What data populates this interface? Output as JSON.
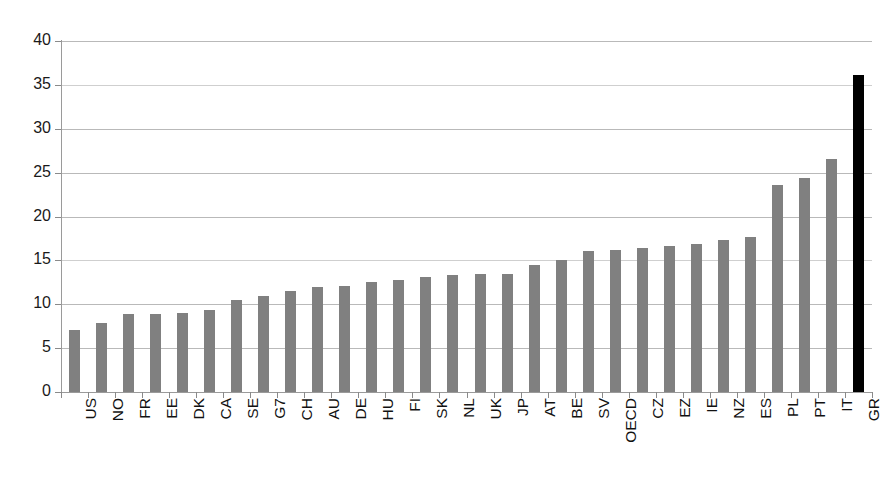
{
  "chart_data": {
    "type": "bar",
    "title": "",
    "subtitle": "",
    "xlabel": "",
    "ylabel": "",
    "ylim": [
      0,
      40
    ],
    "yticks": [
      0,
      5,
      10,
      15,
      20,
      25,
      30,
      35,
      40
    ],
    "grid": true,
    "legend": false,
    "legend_position": "none",
    "orientation": "vertical",
    "bar_color": "#808080",
    "highlight_color": "#000000",
    "highlight_categories": [
      "GR"
    ],
    "categories": [
      "US",
      "NO",
      "FR",
      "EE",
      "DK",
      "CA",
      "SE",
      "G7",
      "CH",
      "AU",
      "DE",
      "HU",
      "FI",
      "SK",
      "NL",
      "UK",
      "JP",
      "AT",
      "BE",
      "SV",
      "OECD",
      "CZ",
      "EZ",
      "IE",
      "NZ",
      "ES",
      "PL",
      "PT",
      "IT",
      "GR"
    ],
    "values": [
      7.1,
      7.9,
      8.9,
      8.9,
      9.0,
      9.3,
      10.5,
      10.9,
      11.5,
      12.0,
      12.1,
      12.5,
      12.8,
      13.1,
      13.3,
      13.5,
      13.5,
      14.5,
      15.0,
      16.1,
      16.2,
      16.4,
      16.6,
      16.9,
      17.3,
      17.7,
      23.6,
      24.4,
      26.6,
      36.1
    ]
  },
  "axis": {
    "y_tick_labels": [
      "40",
      "35",
      "30",
      "25",
      "20",
      "15",
      "10",
      "5",
      "0"
    ]
  }
}
